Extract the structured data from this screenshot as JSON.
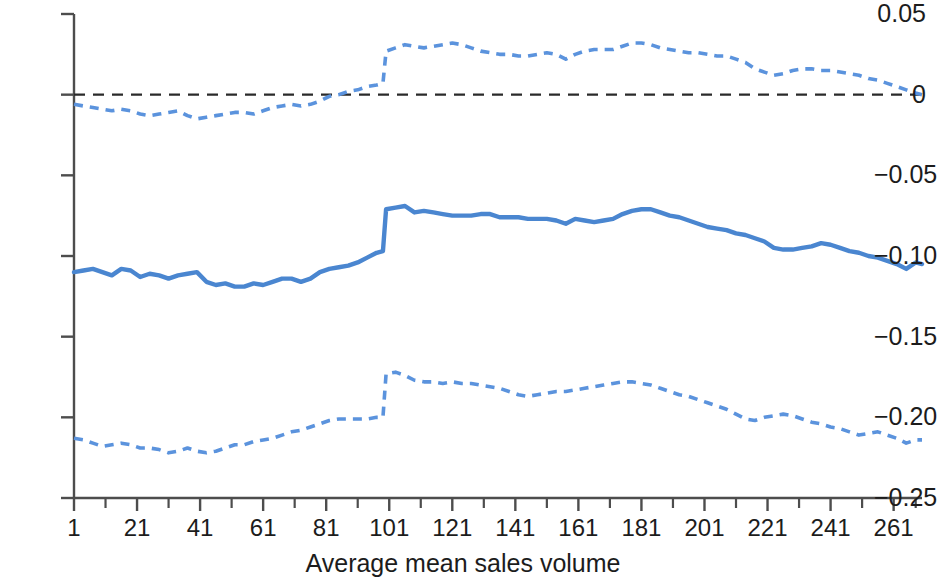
{
  "chart_data": {
    "type": "line",
    "title": "",
    "subtitle": "",
    "xlabel": "Average mean sales volume",
    "ylabel": "",
    "xlim": [
      1,
      270
    ],
    "ylim": [
      -0.25,
      0.05
    ],
    "grid": false,
    "legend": null,
    "colors": {
      "estimate_line": "#4a86d0",
      "confidence_band": "#5b93dd",
      "zero_reference": "#2a2a2a",
      "axis": "#4d4d4d",
      "text": "#1c1c1c"
    },
    "y_ticks": [
      0.05,
      0,
      -0.05,
      -0.1,
      -0.15,
      -0.2,
      -0.25
    ],
    "y_tick_labels": [
      "0.05",
      "0",
      "−0.05",
      "−0.10",
      "−0.15",
      "−0.20",
      "−0.25"
    ],
    "x_ticks_major": [
      1,
      21,
      41,
      61,
      81,
      101,
      121,
      141,
      161,
      181,
      201,
      221,
      241,
      261
    ],
    "x_tick_labels": [
      "1",
      "21",
      "41",
      "61",
      "81",
      "101",
      "121",
      "141",
      "161",
      "181",
      "201",
      "221",
      "241",
      "261"
    ],
    "x_ticks_minor": [
      11,
      31,
      51,
      71,
      91,
      111,
      131,
      151,
      171,
      191,
      211,
      231,
      251,
      268
    ],
    "reference_line": {
      "y": 0,
      "style": "dashed",
      "color": "#2a2a2a"
    },
    "x": [
      1,
      4,
      7,
      10,
      13,
      16,
      19,
      22,
      25,
      28,
      31,
      34,
      37,
      40,
      43,
      46,
      49,
      52,
      55,
      58,
      61,
      64,
      67,
      70,
      73,
      76,
      79,
      82,
      85,
      88,
      91,
      94,
      97,
      99,
      100,
      103,
      106,
      109,
      112,
      115,
      118,
      121,
      124,
      127,
      130,
      133,
      136,
      139,
      142,
      145,
      148,
      151,
      154,
      157,
      160,
      163,
      166,
      169,
      172,
      175,
      178,
      181,
      184,
      187,
      190,
      193,
      196,
      199,
      202,
      205,
      208,
      211,
      214,
      217,
      220,
      223,
      226,
      229,
      232,
      235,
      238,
      241,
      244,
      247,
      250,
      253,
      256,
      259,
      262,
      265,
      268,
      270
    ],
    "series": [
      {
        "name": "Estimate",
        "style": "solid",
        "color": "#4a86d0",
        "values": [
          -0.11,
          -0.109,
          -0.108,
          -0.11,
          -0.112,
          -0.108,
          -0.109,
          -0.113,
          -0.111,
          -0.112,
          -0.114,
          -0.112,
          -0.111,
          -0.11,
          -0.116,
          -0.118,
          -0.117,
          -0.119,
          -0.119,
          -0.117,
          -0.118,
          -0.116,
          -0.114,
          -0.114,
          -0.116,
          -0.114,
          -0.11,
          -0.108,
          -0.107,
          -0.106,
          -0.104,
          -0.101,
          -0.098,
          -0.097,
          -0.071,
          -0.07,
          -0.069,
          -0.073,
          -0.072,
          -0.073,
          -0.074,
          -0.075,
          -0.075,
          -0.075,
          -0.074,
          -0.074,
          -0.076,
          -0.076,
          -0.076,
          -0.077,
          -0.077,
          -0.077,
          -0.078,
          -0.08,
          -0.077,
          -0.078,
          -0.079,
          -0.078,
          -0.077,
          -0.074,
          -0.072,
          -0.071,
          -0.071,
          -0.073,
          -0.075,
          -0.076,
          -0.078,
          -0.08,
          -0.082,
          -0.083,
          -0.084,
          -0.086,
          -0.087,
          -0.089,
          -0.091,
          -0.095,
          -0.096,
          -0.096,
          -0.095,
          -0.094,
          -0.092,
          -0.093,
          -0.095,
          -0.097,
          -0.098,
          -0.1,
          -0.101,
          -0.103,
          -0.105,
          -0.108,
          -0.104,
          -0.105
        ]
      },
      {
        "name": "Upper confidence bound",
        "style": "dashed",
        "color": "#5b93dd",
        "values": [
          -0.006,
          -0.007,
          -0.008,
          -0.009,
          -0.01,
          -0.009,
          -0.01,
          -0.012,
          -0.013,
          -0.012,
          -0.011,
          -0.01,
          -0.013,
          -0.015,
          -0.014,
          -0.013,
          -0.012,
          -0.011,
          -0.011,
          -0.012,
          -0.01,
          -0.008,
          -0.007,
          -0.006,
          -0.007,
          -0.006,
          -0.004,
          -0.001,
          0.0,
          0.002,
          0.003,
          0.005,
          0.006,
          0.007,
          0.027,
          0.029,
          0.031,
          0.03,
          0.029,
          0.03,
          0.031,
          0.032,
          0.031,
          0.029,
          0.027,
          0.026,
          0.025,
          0.025,
          0.024,
          0.024,
          0.025,
          0.026,
          0.025,
          0.022,
          0.025,
          0.027,
          0.028,
          0.028,
          0.028,
          0.03,
          0.032,
          0.032,
          0.031,
          0.029,
          0.028,
          0.027,
          0.026,
          0.026,
          0.025,
          0.024,
          0.024,
          0.022,
          0.02,
          0.016,
          0.014,
          0.012,
          0.013,
          0.015,
          0.016,
          0.016,
          0.015,
          0.015,
          0.014,
          0.013,
          0.012,
          0.01,
          0.009,
          0.007,
          0.005,
          0.003,
          0.001,
          0.0
        ]
      },
      {
        "name": "Lower confidence bound",
        "style": "dashed",
        "color": "#5b93dd",
        "values": [
          -0.213,
          -0.214,
          -0.216,
          -0.218,
          -0.217,
          -0.216,
          -0.217,
          -0.219,
          -0.219,
          -0.22,
          -0.222,
          -0.221,
          -0.219,
          -0.221,
          -0.222,
          -0.221,
          -0.219,
          -0.217,
          -0.217,
          -0.215,
          -0.214,
          -0.213,
          -0.211,
          -0.209,
          -0.208,
          -0.206,
          -0.204,
          -0.202,
          -0.201,
          -0.201,
          -0.201,
          -0.201,
          -0.2,
          -0.2,
          -0.173,
          -0.172,
          -0.174,
          -0.177,
          -0.178,
          -0.178,
          -0.179,
          -0.178,
          -0.179,
          -0.179,
          -0.18,
          -0.181,
          -0.182,
          -0.184,
          -0.186,
          -0.187,
          -0.186,
          -0.185,
          -0.184,
          -0.184,
          -0.183,
          -0.182,
          -0.181,
          -0.18,
          -0.179,
          -0.178,
          -0.178,
          -0.179,
          -0.18,
          -0.182,
          -0.184,
          -0.186,
          -0.187,
          -0.189,
          -0.191,
          -0.193,
          -0.195,
          -0.198,
          -0.201,
          -0.202,
          -0.2,
          -0.199,
          -0.198,
          -0.199,
          -0.201,
          -0.203,
          -0.204,
          -0.206,
          -0.207,
          -0.209,
          -0.211,
          -0.21,
          -0.209,
          -0.211,
          -0.213,
          -0.216,
          -0.214,
          -0.214
        ]
      }
    ]
  }
}
